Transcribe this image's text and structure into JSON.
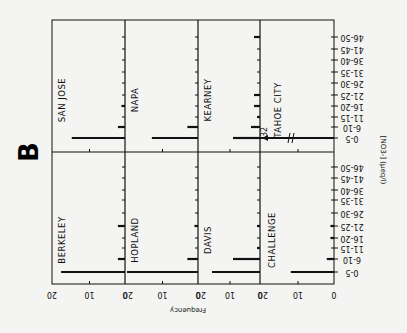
{
  "figure_label": "B",
  "chart_data": {
    "type": "bar",
    "orientation": "figure rotated 90° clockwise; horizontal bars in page coordinates",
    "title": "",
    "xlabel": "[NO3-] (µeq/l)",
    "ylabel": "Frequency",
    "categories": [
      "0-5",
      "6-10",
      "11-15",
      "16-20",
      "21-25",
      "26-30",
      "31-35",
      "36-40",
      "41-45",
      "46-50"
    ],
    "ylim": [
      0,
      20
    ],
    "frequency_ticks": [
      "0",
      "10",
      "20"
    ],
    "grid": false,
    "series": [
      {
        "name": "SAN JOSE",
        "values": [
          15,
          2,
          0,
          1,
          0,
          0,
          0,
          0,
          0,
          0
        ]
      },
      {
        "name": "NAPA",
        "values": [
          13,
          3,
          0,
          0,
          0,
          0,
          0,
          0,
          0,
          0
        ]
      },
      {
        "name": "KEARNEY",
        "values": [
          9,
          3,
          1,
          2,
          2,
          0,
          0,
          0,
          0,
          2
        ]
      },
      {
        "name": "TAHOE CITY",
        "values": [
          32,
          0,
          0,
          0,
          0,
          0,
          0,
          0,
          0,
          0
        ],
        "annotation": "32",
        "broken_axis": true
      },
      {
        "name": "BERKELEY",
        "values": [
          18,
          2,
          0,
          0,
          2,
          0,
          0,
          0,
          0,
          0
        ]
      },
      {
        "name": "HOPLAND",
        "values": [
          20,
          3,
          0,
          0,
          1,
          0,
          0,
          0,
          0,
          0
        ]
      },
      {
        "name": "DAVIS",
        "values": [
          16,
          9,
          1,
          0,
          1,
          0,
          0,
          0,
          0,
          0
        ]
      },
      {
        "name": "CHALLENGE",
        "values": [
          12,
          2,
          0,
          1,
          1,
          0,
          0,
          0,
          0,
          0
        ]
      }
    ],
    "layout": {
      "rows": 2,
      "cols": 4,
      "legend": "none (panel labels inside each panel)"
    }
  },
  "axis": {
    "frequency_title": "Frequency",
    "concentration_title": "[NO3-] (µeq/l)",
    "tick_0": "0",
    "tick_10": "10",
    "tick_20": "20"
  },
  "break_annotation": "32"
}
